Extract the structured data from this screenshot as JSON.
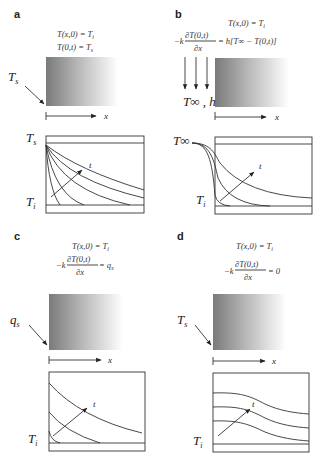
{
  "panels": [
    {
      "label": "a",
      "eq1": "T(x,0) = T",
      "eq1_sub": "i",
      "eq2": "T(0,t) = T",
      "eq2_sub": "s",
      "surface_label": "T",
      "surface_sub": "s",
      "x_axis": "x",
      "top_label": "T",
      "top_sub": "s",
      "bottom_label": "T",
      "bottom_sub": "i",
      "time_label": "t"
    },
    {
      "label": "b",
      "eq1": "T(x,0) = T",
      "eq1_sub": "i",
      "eq2_lhs": "−k",
      "eq2_num": "∂T(0,t)",
      "eq2_den": "∂x",
      "eq2_rhs": "= h[T∞ − T(0,t)]",
      "surface_label": "T∞ , h",
      "x_axis": "x",
      "left_label": "T∞",
      "bottom_label": "T",
      "bottom_sub": "i",
      "time_label": "t"
    },
    {
      "label": "c",
      "eq1": "T(x,0) = T",
      "eq1_sub": "i",
      "eq2_lhs": "−k",
      "eq2_num": "∂T(0,t)",
      "eq2_den": "∂x",
      "eq2_rhs": "= q",
      "eq2_rhs_sub": "s",
      "surface_label": "q",
      "surface_sub": "s",
      "x_axis": "x",
      "bottom_label": "T",
      "bottom_sub": "i",
      "time_label": "t"
    },
    {
      "label": "d",
      "eq1": "T(x,0) = T",
      "eq1_sub": "i",
      "eq2_lhs": "−k",
      "eq2_num": "∂T(0,t)",
      "eq2_den": "∂x",
      "eq2_rhs": "= 0",
      "surface_label": "T",
      "surface_sub": "s",
      "x_axis": "x",
      "bottom_label": "T",
      "bottom_sub": "i",
      "time_label": "t"
    }
  ],
  "colors": {
    "gradient_dark": "#7a7a7a",
    "gradient_light": "#ffffff",
    "line": "#333333"
  }
}
